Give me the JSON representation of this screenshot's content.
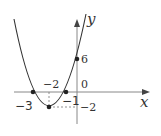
{
  "diagram": {
    "function": "parabola through (-3,0), (-1,0), vertex (-2,-2), y-intercept (0,6)",
    "axis_labels": {
      "x": "x",
      "y": "y"
    },
    "labels": {
      "y_intercept": "6",
      "origin": "0",
      "vertex_x": "−2",
      "vertex_y": "−2",
      "root_left": "−3",
      "root_right": "−1"
    },
    "points": [
      {
        "name": "root-left",
        "x": -3,
        "y": 0
      },
      {
        "name": "root-right",
        "x": -1,
        "y": 0
      },
      {
        "name": "vertex",
        "x": -2,
        "y": -2
      },
      {
        "name": "y-intercept",
        "x": 0,
        "y": 6
      }
    ]
  }
}
